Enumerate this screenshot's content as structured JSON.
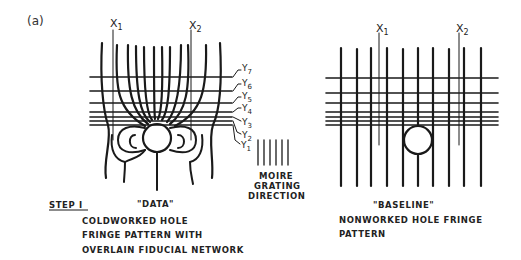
{
  "figure": {
    "panel_label": "(a)",
    "left": {
      "x_labels": [
        "X1",
        "X2"
      ],
      "y_labels": [
        "Y7",
        "Y6",
        "Y5",
        "Y4",
        "Y3",
        "Y2",
        "Y1"
      ],
      "quote_label": "\"DATA\"",
      "step_label": "STEP I",
      "caption_lines": [
        "COLDWORKED HOLE",
        "FRINGE PATTERN WITH",
        "OVERLAIN FIDUCIAL NETWORK"
      ]
    },
    "middle": {
      "grating_lines": 6,
      "caption_lines": [
        "MOIRE",
        "GRATING",
        "DIRECTION"
      ]
    },
    "right": {
      "x_labels": [
        "X1",
        "X2"
      ],
      "quote_label": "\"BASELINE\"",
      "caption_lines": [
        "NONWORKED HOLE FRINGE",
        "PATTERN"
      ]
    }
  }
}
